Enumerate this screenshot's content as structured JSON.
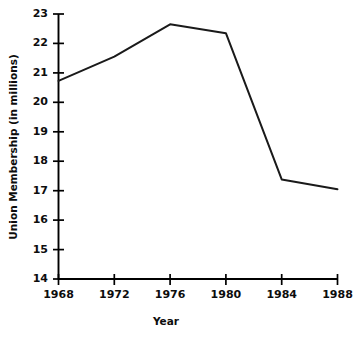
{
  "chart_data": {
    "type": "line",
    "title": "",
    "subtitle": "",
    "xlabel": "Year",
    "ylabel": "Union Membership (in millions)",
    "x": [
      1968,
      1972,
      1976,
      1980,
      1984,
      1988
    ],
    "values": [
      20.73,
      21.55,
      22.65,
      22.35,
      17.38,
      17.05
    ],
    "series": [
      {
        "name": "Union Membership",
        "values": [
          20.73,
          21.55,
          22.65,
          22.35,
          17.38,
          17.05
        ],
        "color": "#1a1a1a"
      }
    ],
    "xlim": [
      1968,
      1988
    ],
    "ylim": [
      14,
      23
    ],
    "xticks": [
      1968,
      1972,
      1976,
      1980,
      1984,
      1988
    ],
    "xtick_labels": [
      "1968",
      "1972",
      "1976",
      "1980",
      "1984",
      "1988"
    ],
    "yticks": [
      14,
      15,
      16,
      17,
      18,
      19,
      20,
      21,
      22,
      23
    ],
    "ytick_labels": [
      "14",
      "15",
      "16",
      "17",
      "18",
      "19",
      "20",
      "21",
      "22",
      "23"
    ],
    "grid": false,
    "legend": false,
    "legend_position": "none",
    "line_color": "#1a1a1a",
    "background_color": "#ffffff",
    "axis_color": "#000000",
    "annotations": []
  },
  "axes": {
    "y_title": "Union Membership (in millions)",
    "x_title": "Year"
  }
}
